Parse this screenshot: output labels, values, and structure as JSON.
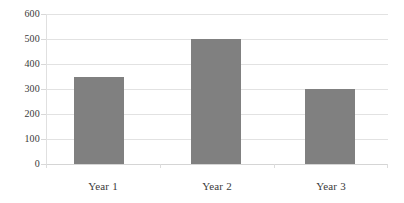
{
  "chart_data": {
    "type": "bar",
    "title": "",
    "subtitle": "",
    "xlabel": "",
    "ylabel": "",
    "categories": [
      "Year 1",
      "Year 2",
      "Year 3"
    ],
    "values": [
      350,
      500,
      300
    ],
    "ylim": [
      0,
      600
    ],
    "y_ticks": [
      0,
      100,
      200,
      300,
      400,
      500,
      600
    ],
    "y_tick_labels": [
      "0",
      "100",
      "200",
      "300",
      "400",
      "500",
      "600"
    ],
    "grid": "horizontal",
    "legend": "none",
    "legend_position": "none",
    "series": [
      {
        "name": "",
        "values": [
          350,
          500,
          300
        ],
        "color": "#808080"
      }
    ],
    "annotations": []
  },
  "style": {
    "bar_color": "#808080",
    "gridline_color": "#e2e2e2",
    "baseline_color": "#d5d5d5",
    "axis_line_color": "#e0e0e0",
    "text_color": "#3a3a3a",
    "background_color": "#ffffff"
  }
}
